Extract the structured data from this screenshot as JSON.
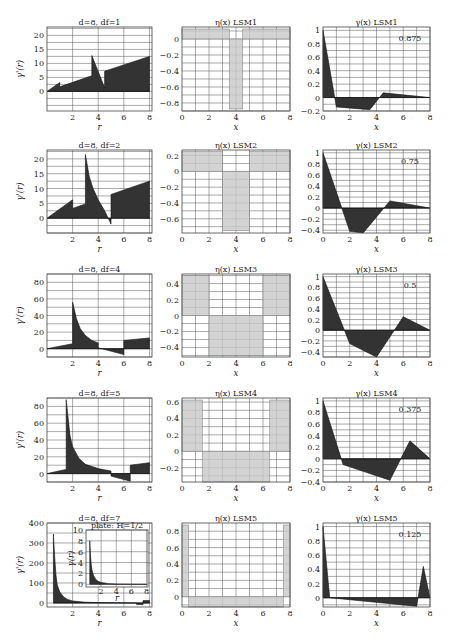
{
  "figure": {
    "rows": 5,
    "columns": [
      "gamma_r",
      "eta_x",
      "gamma_x"
    ]
  },
  "chart_data": [
    {
      "id": "r1c1",
      "type": "area",
      "title": "d=8, d_f=1",
      "xlabel": "r",
      "ylabel": "γ'(r)",
      "xlim": [
        0,
        8.2
      ],
      "ylim": [
        -7,
        23
      ],
      "xticks": [
        2,
        4,
        6,
        8
      ],
      "yticks": [
        0,
        5,
        10,
        15,
        20
      ],
      "x": [
        0,
        1.0,
        1.0,
        1.1,
        3.5,
        3.5,
        4.5,
        4.5,
        8
      ],
      "y": [
        0,
        3.2,
        1.5,
        1.8,
        5.6,
        12.8,
        1.3,
        7.2,
        12.5
      ]
    },
    {
      "id": "r1c2",
      "type": "bar",
      "title": "η(x)   LSM1",
      "xlabel": "x",
      "xlim": [
        0,
        8
      ],
      "ylim": [
        -0.9,
        0.15
      ],
      "xticks": [
        0,
        2,
        4,
        6,
        8
      ],
      "yticks": [
        0,
        -0.2,
        -0.4,
        -0.6,
        -0.8
      ],
      "bars": [
        {
          "x0": 0,
          "x1": 3.5,
          "v": 0.125
        },
        {
          "x0": 3.5,
          "x1": 4.5,
          "v": -0.875
        },
        {
          "x0": 4.5,
          "x1": 8,
          "v": 0.125
        }
      ]
    },
    {
      "id": "r1c3",
      "type": "area",
      "title": "γ(x)   LSM1",
      "annotation": "0.875",
      "xlabel": "x",
      "xlim": [
        0,
        8
      ],
      "ylim": [
        -0.2,
        1.05
      ],
      "xticks": [
        0,
        2,
        4,
        6,
        8
      ],
      "yticks": [
        1,
        0.8,
        0.6,
        0.4,
        0.2,
        0,
        -0.2
      ],
      "x": [
        0,
        1,
        3.5,
        4.5,
        8
      ],
      "y": [
        1,
        -0.14,
        -0.18,
        0.07,
        0
      ]
    },
    {
      "id": "r2c1",
      "type": "area",
      "title": "d=8, d_f=2",
      "xlabel": "r",
      "ylabel": "γ'(r)",
      "xlim": [
        0,
        8.2
      ],
      "ylim": [
        -5,
        23
      ],
      "xticks": [
        2,
        4,
        6,
        8
      ],
      "yticks": [
        0,
        5,
        10,
        15,
        20
      ],
      "x": [
        0,
        2,
        2,
        3,
        3,
        3.3,
        3.6,
        4,
        4.5,
        5,
        5,
        8
      ],
      "y": [
        0,
        6.2,
        3.3,
        4.8,
        21.5,
        14,
        10,
        6.2,
        2.5,
        -2,
        8,
        12.5
      ]
    },
    {
      "id": "r2c2",
      "type": "bar",
      "title": "η(x)   LSM2",
      "xlabel": "x",
      "xlim": [
        0,
        8
      ],
      "ylim": [
        -0.78,
        0.27
      ],
      "xticks": [
        0,
        2,
        4,
        6,
        8
      ],
      "yticks": [
        0.2,
        0,
        -0.2,
        -0.4,
        -0.6
      ],
      "bars": [
        {
          "x0": 0,
          "x1": 3,
          "v": 0.25
        },
        {
          "x0": 3,
          "x1": 5,
          "v": -0.75
        },
        {
          "x0": 5,
          "x1": 8,
          "v": 0.25
        }
      ]
    },
    {
      "id": "r2c3",
      "type": "area",
      "title": "γ(x)   LSM2",
      "annotation": "0.75",
      "xlabel": "x",
      "xlim": [
        0,
        8
      ],
      "ylim": [
        -0.45,
        1.05
      ],
      "xticks": [
        0,
        2,
        4,
        6,
        8
      ],
      "yticks": [
        1,
        0.8,
        0.6,
        0.4,
        0.2,
        0,
        -0.2,
        -0.4
      ],
      "x": [
        0,
        2,
        3,
        5,
        8
      ],
      "y": [
        1,
        -0.42,
        -0.45,
        0.13,
        0
      ]
    },
    {
      "id": "r3c1",
      "type": "area",
      "title": "d=8, d_f=4",
      "xlabel": "r",
      "ylabel": "γ'(r)",
      "xlim": [
        0,
        8.2
      ],
      "ylim": [
        -10,
        90
      ],
      "xticks": [
        2,
        4,
        6,
        8
      ],
      "yticks": [
        0,
        20,
        40,
        60,
        80
      ],
      "x": [
        0,
        2,
        2,
        2.3,
        2.6,
        3,
        3.5,
        4,
        4,
        6,
        6,
        8
      ],
      "y": [
        0,
        6,
        56,
        36,
        24,
        16,
        10,
        7,
        1,
        -7,
        10,
        13
      ]
    },
    {
      "id": "r3c2",
      "type": "bar",
      "title": "η(x)   LSM3",
      "xlabel": "x",
      "xlim": [
        0,
        8
      ],
      "ylim": [
        -0.52,
        0.52
      ],
      "xticks": [
        0,
        2,
        4,
        6,
        8
      ],
      "yticks": [
        0.4,
        0.2,
        0,
        -0.2,
        -0.4
      ],
      "bars": [
        {
          "x0": 0,
          "x1": 2,
          "v": 0.5
        },
        {
          "x0": 2,
          "x1": 6,
          "v": -0.5
        },
        {
          "x0": 6,
          "x1": 8,
          "v": 0.5
        }
      ]
    },
    {
      "id": "r3c3",
      "type": "area",
      "title": "γ(x)   LSM3",
      "annotation": "0.5",
      "xlabel": "x",
      "xlim": [
        0,
        8
      ],
      "ylim": [
        -0.5,
        1.05
      ],
      "xticks": [
        0,
        2,
        4,
        6,
        8
      ],
      "yticks": [
        1,
        0.8,
        0.6,
        0.4,
        0.2,
        0,
        -0.2,
        -0.4
      ],
      "x": [
        0,
        2,
        4,
        6,
        8
      ],
      "y": [
        1,
        -0.25,
        -0.5,
        0.25,
        0
      ]
    },
    {
      "id": "r4c1",
      "type": "area",
      "title": "d=8, d_f=5",
      "xlabel": "r",
      "ylabel": "γ'(r)",
      "xlim": [
        0,
        8.2
      ],
      "ylim": [
        -10,
        90
      ],
      "xticks": [
        2,
        4,
        6,
        8
      ],
      "yticks": [
        0,
        20,
        40,
        60,
        80
      ],
      "x": [
        0,
        1.5,
        1.5,
        1.8,
        2,
        2.5,
        3,
        4,
        5,
        5,
        6.5,
        6.5,
        8
      ],
      "y": [
        0,
        5,
        88,
        45,
        32,
        18,
        11,
        6,
        3,
        -3,
        -9,
        10,
        13
      ]
    },
    {
      "id": "r4c2",
      "type": "bar",
      "title": "η(x)   LSM4",
      "xlabel": "x",
      "xlim": [
        0,
        8
      ],
      "ylim": [
        -0.375,
        0.65
      ],
      "xticks": [
        0,
        2,
        4,
        6,
        8
      ],
      "yticks": [
        0.6,
        0.4,
        0.2,
        0,
        -0.2
      ],
      "bars": [
        {
          "x0": 0,
          "x1": 1.5,
          "v": 0.625
        },
        {
          "x0": 1.5,
          "x1": 6.5,
          "v": -0.375
        },
        {
          "x0": 6.5,
          "x1": 8,
          "v": 0.625
        }
      ]
    },
    {
      "id": "r4c3",
      "type": "area",
      "title": "γ(x)   LSM4",
      "annotation": "0.375",
      "xlabel": "x",
      "xlim": [
        0,
        8
      ],
      "ylim": [
        -0.4,
        1.05
      ],
      "xticks": [
        0,
        2,
        4,
        6,
        8
      ],
      "yticks": [
        1,
        0.8,
        0.6,
        0.4,
        0.2,
        0,
        -0.2,
        -0.4
      ],
      "x": [
        0,
        1.5,
        5,
        6.5,
        8
      ],
      "y": [
        1,
        -0.1,
        -0.37,
        0.31,
        0
      ]
    },
    {
      "id": "r5c1",
      "type": "area",
      "title": "d=8, d_f=7",
      "xlabel": "r",
      "ylabel": "γ'(r)",
      "xlim": [
        0,
        8.2
      ],
      "ylim": [
        -20,
        400
      ],
      "xticks": [
        2,
        4,
        6,
        8
      ],
      "yticks": [
        0,
        100,
        200,
        300,
        400
      ],
      "x": [
        0.5,
        0.5,
        0.6,
        0.7,
        0.8,
        1,
        1.3,
        1.6,
        2,
        3,
        4,
        5,
        7,
        7,
        7.5,
        7.5,
        8
      ],
      "y": [
        0,
        345,
        230,
        140,
        90,
        55,
        30,
        18,
        10,
        4,
        2,
        1,
        0,
        -8,
        -8,
        12,
        12
      ],
      "inset": {
        "title": "plate: H=1/2",
        "xlabel": "r",
        "ylabel": "γ(r)",
        "xlim": [
          0,
          8.2
        ],
        "ylim": [
          -0.5,
          10
        ],
        "xticks": [
          2,
          4,
          6,
          8
        ],
        "yticks": [
          0,
          2,
          4,
          6,
          8,
          10
        ],
        "x": [
          0.5,
          0.5,
          0.6,
          0.7,
          0.8,
          1,
          1.3,
          1.6,
          2,
          3,
          4,
          6,
          8
        ],
        "y": [
          0,
          8,
          5.2,
          3.6,
          2.6,
          1.6,
          0.9,
          0.55,
          0.35,
          0.12,
          0.05,
          0.02,
          0
        ]
      }
    },
    {
      "id": "r5c2",
      "type": "bar",
      "title": "η(x)   LSM5",
      "xlabel": "x",
      "xlim": [
        0,
        8
      ],
      "ylim": [
        -0.125,
        0.9
      ],
      "xticks": [
        0,
        2,
        4,
        6,
        8
      ],
      "yticks": [
        0.8,
        0.6,
        0.4,
        0.2,
        0
      ],
      "bars": [
        {
          "x0": 0,
          "x1": 0.5,
          "v": 0.875
        },
        {
          "x0": 0.5,
          "x1": 7.5,
          "v": -0.125
        },
        {
          "x0": 7.5,
          "x1": 8,
          "v": 0.875
        }
      ]
    },
    {
      "id": "r5c3",
      "type": "area",
      "title": "γ(x)   LSM5",
      "annotation": "0.125",
      "xlabel": "x",
      "xlim": [
        0,
        8
      ],
      "ylim": [
        -0.13,
        1.05
      ],
      "xticks": [
        0,
        2,
        4,
        6,
        8
      ],
      "yticks": [
        1,
        0.8,
        0.6,
        0.4,
        0.2,
        0
      ],
      "x": [
        0,
        0.5,
        7,
        7.5,
        8
      ],
      "y": [
        1,
        0,
        -0.12,
        0.44,
        0
      ]
    }
  ],
  "layout": {
    "col_x": [
      [
        47,
        152
      ],
      [
        182,
        290
      ],
      [
        323,
        430
      ]
    ],
    "row_y": [
      [
        27,
        111
      ],
      [
        150,
        233
      ],
      [
        274,
        357
      ],
      [
        398,
        482
      ],
      [
        523,
        607
      ]
    ],
    "inset_frame": [
      86,
      530,
      148,
      587
    ]
  },
  "colors": {
    "area": "#333333",
    "bar": "#c8c8c8",
    "bar_edge": "#888888",
    "grid": "#555555"
  }
}
